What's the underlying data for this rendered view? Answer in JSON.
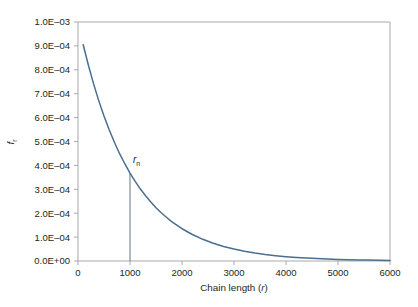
{
  "chart_data": {
    "type": "line",
    "title": "",
    "subtitle": "",
    "xlabel_prefix": "Chain length (",
    "xlabel_symbol": "r",
    "xlabel_suffix": ")",
    "ylabel_symbol": "f",
    "ylabel_subscript": "r",
    "xlim": [
      0,
      6000
    ],
    "ylim": [
      0.0,
      0.001
    ],
    "grid": false,
    "legend": "none",
    "x_ticks": [
      0,
      1000,
      2000,
      3000,
      4000,
      5000,
      6000
    ],
    "x_tick_labels": [
      "0",
      "1000",
      "2000",
      "3000",
      "4000",
      "5000",
      "6000"
    ],
    "y_ticks": [
      0.0,
      0.0001,
      0.0002,
      0.0003,
      0.0004,
      0.0005,
      0.0006,
      0.0007,
      0.0008,
      0.0009,
      0.001
    ],
    "y_tick_labels": [
      "0.0E+00",
      "1.0E‒04",
      "2.0E‒04",
      "3.0E‒04",
      "4.0E‒04",
      "5.0E‒04",
      "6.0E‒04",
      "7.0E‒04",
      "8.0E‒04",
      "9.0E‒04",
      "1.0E‒03"
    ],
    "series": [
      {
        "name": "Flory chain length distribution",
        "color": "#4a6e8f",
        "x": [
          100,
          200,
          300,
          400,
          500,
          600,
          700,
          800,
          900,
          1000,
          1100,
          1200,
          1300,
          1400,
          1500,
          1600,
          1700,
          1800,
          1900,
          2000,
          2200,
          2400,
          2600,
          2800,
          3000,
          3200,
          3400,
          3600,
          3800,
          4000,
          4200,
          4400,
          4600,
          4800,
          5000,
          5200,
          5400,
          5600,
          5800,
          6000
        ],
        "values": [
          0.000905,
          0.000819,
          0.000741,
          0.00067,
          0.000607,
          0.000549,
          0.000497,
          0.000449,
          0.000407,
          0.000368,
          0.000333,
          0.000301,
          0.000273,
          0.000247,
          0.000223,
          0.000202,
          0.000183,
          0.000165,
          0.00015,
          0.000135,
          0.000111,
          9.07e-05,
          7.43e-05,
          6.08e-05,
          4.98e-05,
          4.08e-05,
          3.34e-05,
          2.73e-05,
          2.24e-05,
          1.83e-05,
          1.5e-05,
          1.23e-05,
          1.01e-05,
          8.2e-06,
          6.7e-06,
          5.5e-06,
          4.5e-06,
          3.7e-06,
          3e-06,
          2.5e-06
        ]
      }
    ],
    "annotations": [
      {
        "name": "number-average-chain-length",
        "symbol": "r",
        "subscript": "n",
        "x": 1000,
        "y_top": 0.000368,
        "y_bottom": 0.0,
        "marker_color": "#6d8196"
      }
    ]
  }
}
